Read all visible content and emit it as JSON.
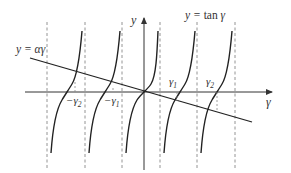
{
  "diagram": {
    "colors": {
      "curve": "#222222",
      "axis": "#333333",
      "asymptote": "#777777",
      "text": "#333333"
    },
    "axes": {
      "x_label": "γ",
      "y_label": "y"
    },
    "curves": {
      "tan_label_prefix": "y = ",
      "tan_label_func": "tan",
      "tan_label_var": " γ",
      "line_label": "y = αγ"
    },
    "roots": [
      {
        "name": "neg-gamma-2",
        "base": "−γ",
        "sub": "2"
      },
      {
        "name": "neg-gamma-1",
        "base": "−γ",
        "sub": "1"
      },
      {
        "name": "gamma-1",
        "base": "γ",
        "sub": "1"
      },
      {
        "name": "gamma-2",
        "base": "γ",
        "sub": "2"
      }
    ],
    "asymptote_count": 6,
    "tan_branch_count": 5
  }
}
